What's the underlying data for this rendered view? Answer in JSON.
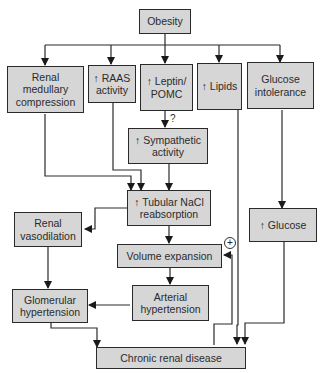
{
  "diagram": {
    "nodes": {
      "obesity": "Obesity",
      "renal_medullary": "Renal\nmedullary\ncompression",
      "raas": "↑ RAAS\nactivity",
      "leptin": "↑ Leptin/\nPOMC",
      "lipids": "↑ Lipids",
      "glucose_intolerance": "Glucose\nintolerance",
      "sympathetic": "↑ Sympathetic\nactivity",
      "tubular": "↑ Tubular NaCl\nreabsorption",
      "renal_vasodilation": "Renal\nvasodilation",
      "glucose": "↑ Glucose",
      "volume_expansion": "Volume expansion",
      "arterial_hypertension": "Arterial\nhypertension",
      "glomerular_hypertension": "Glomerular\nhypertension",
      "chronic_renal": "Chronic renal disease"
    },
    "annotations": {
      "uncertain_link": "?",
      "positive_feedback": "+"
    },
    "edges": [
      [
        "obesity",
        "renal_medullary"
      ],
      [
        "obesity",
        "raas"
      ],
      [
        "obesity",
        "leptin"
      ],
      [
        "obesity",
        "lipids"
      ],
      [
        "obesity",
        "glucose_intolerance"
      ],
      [
        "leptin",
        "sympathetic"
      ],
      [
        "renal_medullary",
        "tubular"
      ],
      [
        "raas",
        "tubular"
      ],
      [
        "sympathetic",
        "tubular"
      ],
      [
        "tubular",
        "renal_vasodilation"
      ],
      [
        "tubular",
        "volume_expansion"
      ],
      [
        "glucose_intolerance",
        "glucose"
      ],
      [
        "renal_vasodilation",
        "glomerular_hypertension"
      ],
      [
        "volume_expansion",
        "arterial_hypertension"
      ],
      [
        "arterial_hypertension",
        "glomerular_hypertension"
      ],
      [
        "glomerular_hypertension",
        "chronic_renal"
      ],
      [
        "lipids",
        "chronic_renal"
      ],
      [
        "glucose",
        "chronic_renal"
      ],
      [
        "chronic_renal",
        "volume_expansion"
      ]
    ],
    "colors": {
      "box_fill": "#d6d6d6",
      "line": "#2a2a2a"
    }
  }
}
